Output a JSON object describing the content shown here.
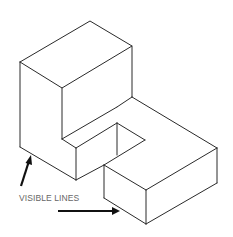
{
  "figure": {
    "line_color": "#2a2a2a",
    "annotation": {
      "label": "VISIBLE LINES",
      "arrows": [
        {
          "name": "arrow-left",
          "from": [
            21,
            186
          ],
          "to": [
            31,
            155
          ]
        },
        {
          "name": "arrow-bottom",
          "from": [
            58,
            211
          ],
          "to": [
            120,
            211
          ]
        }
      ]
    }
  }
}
